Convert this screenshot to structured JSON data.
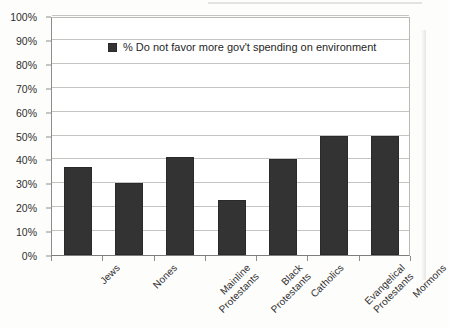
{
  "chart_data": {
    "type": "bar",
    "title": "",
    "xlabel": "",
    "ylabel": "",
    "ylim": [
      0,
      100
    ],
    "grid": true,
    "legend_position": "top-left",
    "categories": [
      "Jews",
      "Nones",
      "Mainline Protestants",
      "Black Protestants",
      "Catholics",
      "Evangelical Protestants",
      "Mormons"
    ],
    "category_lines": [
      [
        "Jews"
      ],
      [
        "Nones"
      ],
      [
        "Mainline",
        "Protestants"
      ],
      [
        "Black",
        "Protestants"
      ],
      [
        "Catholics"
      ],
      [
        "Evangelical",
        "Protestants"
      ],
      [
        "Mormons"
      ]
    ],
    "series": [
      {
        "name": "% Do not favor more gov't spending on environment",
        "values": [
          37,
          30,
          41,
          23,
          40,
          50,
          50
        ],
        "color": "#333333"
      }
    ],
    "y_ticks": [
      0,
      10,
      20,
      30,
      40,
      50,
      60,
      70,
      80,
      90,
      100
    ],
    "y_tick_labels": [
      "0%",
      "10%",
      "20%",
      "30%",
      "40%",
      "50%",
      "60%",
      "70%",
      "80%",
      "90%",
      "100%"
    ]
  },
  "legend": {
    "swatch_icon": "legend-square-swatch",
    "label": "% Do not favor more gov't spending on environment"
  },
  "caption": {
    "text": ""
  }
}
